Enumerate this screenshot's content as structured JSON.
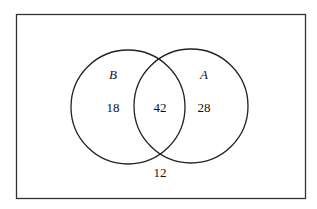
{
  "diagram": {
    "type": "venn",
    "universe_label": "",
    "sets": [
      {
        "name": "B",
        "only_count": "18"
      },
      {
        "name": "A",
        "only_count": "28"
      }
    ],
    "intersection_count": "42",
    "outside_count": "12",
    "colors": {
      "stroke": "#222222",
      "background": "#ffffff"
    }
  }
}
